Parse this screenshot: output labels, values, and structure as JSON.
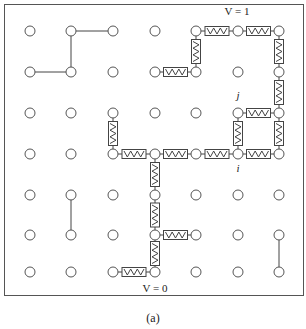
{
  "figure": {
    "caption": "(a)",
    "labels": {
      "top_voltage": "V = 1",
      "bottom_voltage": "V = 0",
      "node_j": "j",
      "node_i": "i"
    },
    "colors": {
      "stroke": "#444444",
      "background": "#ffffff"
    }
  },
  "grid": {
    "cols": [
      30,
      71,
      113,
      155,
      196,
      238,
      279
    ],
    "rows": [
      31,
      72,
      113,
      154,
      195,
      235,
      272
    ],
    "node_radius": 5
  },
  "wires": [
    [
      [
        0,
        1
      ],
      [
        0,
        2
      ]
    ],
    [
      [
        0,
        1
      ],
      [
        1,
        1
      ]
    ],
    [
      [
        1,
        0
      ],
      [
        1,
        1
      ]
    ],
    [
      [
        4,
        1
      ],
      [
        5,
        1
      ]
    ],
    [
      [
        5,
        6
      ],
      [
        6,
        6
      ]
    ]
  ],
  "resistors": [
    [
      [
        0,
        4
      ],
      [
        0,
        5
      ]
    ],
    [
      [
        0,
        5
      ],
      [
        0,
        6
      ]
    ],
    [
      [
        0,
        4
      ],
      [
        1,
        4
      ]
    ],
    [
      [
        1,
        3
      ],
      [
        1,
        4
      ]
    ],
    [
      [
        0,
        6
      ],
      [
        1,
        6
      ]
    ],
    [
      [
        1,
        6
      ],
      [
        2,
        6
      ]
    ],
    [
      [
        2,
        5
      ],
      [
        2,
        6
      ]
    ],
    [
      [
        2,
        5
      ],
      [
        3,
        5
      ]
    ],
    [
      [
        2,
        6
      ],
      [
        3,
        6
      ]
    ],
    [
      [
        2,
        2
      ],
      [
        3,
        2
      ]
    ],
    [
      [
        3,
        2
      ],
      [
        3,
        3
      ]
    ],
    [
      [
        3,
        3
      ],
      [
        3,
        4
      ]
    ],
    [
      [
        3,
        4
      ],
      [
        3,
        5
      ]
    ],
    [
      [
        3,
        5
      ],
      [
        3,
        6
      ]
    ],
    [
      [
        3,
        3
      ],
      [
        4,
        3
      ]
    ],
    [
      [
        4,
        3
      ],
      [
        5,
        3
      ]
    ],
    [
      [
        5,
        3
      ],
      [
        6,
        3
      ]
    ],
    [
      [
        5,
        3
      ],
      [
        5,
        4
      ]
    ],
    [
      [
        6,
        2
      ],
      [
        6,
        3
      ]
    ]
  ]
}
